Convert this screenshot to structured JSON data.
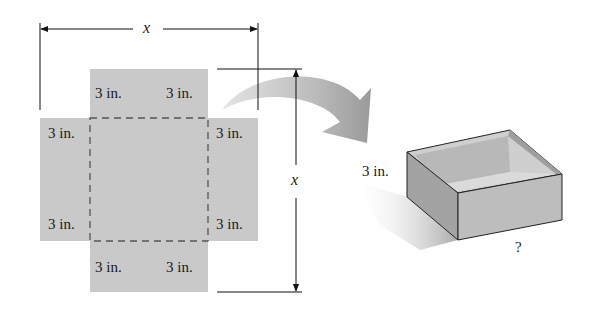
{
  "diagram": {
    "net": {
      "flap_labels": {
        "top_left": "3 in.",
        "top_right": "3 in.",
        "left_top": "3 in.",
        "right_top": "3 in.",
        "left_bottom": "3 in.",
        "right_bottom": "3 in.",
        "bottom_left": "3 in.",
        "bottom_right": "3 in."
      },
      "width_label": "x",
      "height_label": "x"
    },
    "box": {
      "height_label": "3 in.",
      "unknown_label": "?"
    },
    "colors": {
      "paper": "#c9c9c9",
      "dash": "#555555",
      "line": "#111111",
      "box_front": "#bdbdbd",
      "box_side": "#a3a3a3",
      "box_inside": "#d4d4d4"
    }
  }
}
